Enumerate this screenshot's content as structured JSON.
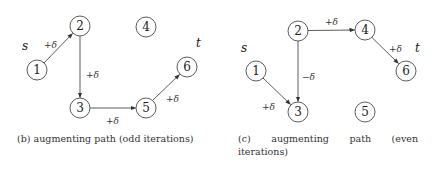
{
  "panels": [
    {
      "id": "b",
      "caption": "(b) augmenting path (odd iterations)",
      "source_label": "s",
      "sink_label": "t",
      "nodes": [
        {
          "id": "1",
          "x": 37,
          "y": 70
        },
        {
          "id": "2",
          "x": 80,
          "y": 26
        },
        {
          "id": "3",
          "x": 80,
          "y": 108
        },
        {
          "id": "4",
          "x": 146,
          "y": 27
        },
        {
          "id": "5",
          "x": 146,
          "y": 108
        },
        {
          "id": "6",
          "x": 187,
          "y": 67
        }
      ],
      "edges": [
        {
          "from": "1",
          "to": "2",
          "label": "+δ"
        },
        {
          "from": "2",
          "to": "3",
          "label": "+δ"
        },
        {
          "from": "3",
          "to": "5",
          "label": "+δ"
        },
        {
          "from": "5",
          "to": "6",
          "label": "+δ"
        }
      ]
    },
    {
      "id": "c",
      "caption": "(c) augmenting path (even iterations)",
      "source_label": "s",
      "sink_label": "t",
      "nodes": [
        {
          "id": "1",
          "x": 256,
          "y": 71
        },
        {
          "id": "2",
          "x": 298,
          "y": 31
        },
        {
          "id": "3",
          "x": 298,
          "y": 112
        },
        {
          "id": "4",
          "x": 365,
          "y": 30
        },
        {
          "id": "5",
          "x": 365,
          "y": 112
        },
        {
          "id": "6",
          "x": 406,
          "y": 71
        }
      ],
      "edges": [
        {
          "from": "1",
          "to": "3",
          "label": "+δ"
        },
        {
          "from": "2",
          "to": "3",
          "label": "−δ"
        },
        {
          "from": "2",
          "to": "4",
          "label": "+δ"
        },
        {
          "from": "4",
          "to": "6",
          "label": "+δ"
        }
      ]
    }
  ]
}
